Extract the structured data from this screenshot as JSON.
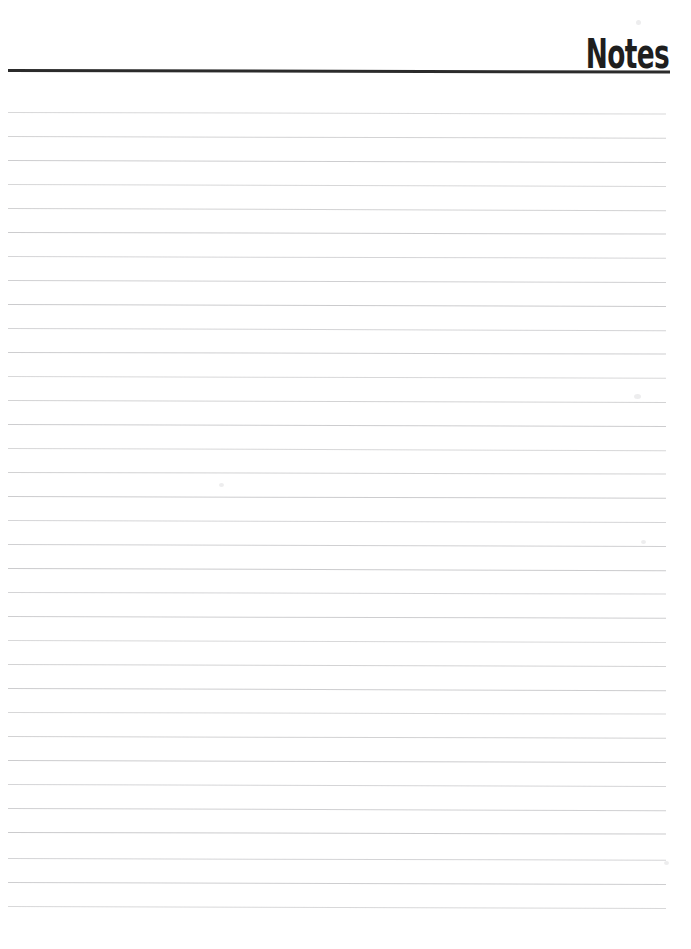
{
  "document": {
    "type": "lined-notes-page",
    "background_color": "#ffffff",
    "width": 691,
    "height": 949
  },
  "header": {
    "title": "Notes",
    "title_color": "#1e1e1e",
    "rule_color": "#2b2b2b",
    "rule_thickness_px": 3,
    "rule_left_px": 8,
    "rule_right_px": 670,
    "rule_y_px": 69,
    "title_align": "right"
  },
  "body": {
    "line_color": "#c9c9cb",
    "line_thickness_px": 1,
    "line_left_px": 8,
    "line_right_px": 666,
    "first_line_y_px": 112,
    "line_spacing_px": 24,
    "line_count": 34,
    "content_text": "",
    "lines": [
      {
        "index": 1,
        "y": 112,
        "text": ""
      },
      {
        "index": 2,
        "y": 136,
        "text": ""
      },
      {
        "index": 3,
        "y": 160,
        "text": ""
      },
      {
        "index": 4,
        "y": 184,
        "text": ""
      },
      {
        "index": 5,
        "y": 208,
        "text": ""
      },
      {
        "index": 6,
        "y": 232,
        "text": ""
      },
      {
        "index": 7,
        "y": 256,
        "text": ""
      },
      {
        "index": 8,
        "y": 280,
        "text": ""
      },
      {
        "index": 9,
        "y": 304,
        "text": ""
      },
      {
        "index": 10,
        "y": 328,
        "text": ""
      },
      {
        "index": 11,
        "y": 352,
        "text": ""
      },
      {
        "index": 12,
        "y": 376,
        "text": ""
      },
      {
        "index": 13,
        "y": 400,
        "text": ""
      },
      {
        "index": 14,
        "y": 424,
        "text": ""
      },
      {
        "index": 15,
        "y": 448,
        "text": ""
      },
      {
        "index": 16,
        "y": 472,
        "text": ""
      },
      {
        "index": 17,
        "y": 496,
        "text": ""
      },
      {
        "index": 18,
        "y": 520,
        "text": ""
      },
      {
        "index": 19,
        "y": 544,
        "text": ""
      },
      {
        "index": 20,
        "y": 568,
        "text": ""
      },
      {
        "index": 21,
        "y": 592,
        "text": ""
      },
      {
        "index": 22,
        "y": 616,
        "text": ""
      },
      {
        "index": 23,
        "y": 640,
        "text": ""
      },
      {
        "index": 24,
        "y": 664,
        "text": ""
      },
      {
        "index": 25,
        "y": 688,
        "text": ""
      },
      {
        "index": 26,
        "y": 712,
        "text": ""
      },
      {
        "index": 27,
        "y": 736,
        "text": ""
      },
      {
        "index": 28,
        "y": 760,
        "text": ""
      },
      {
        "index": 29,
        "y": 784,
        "text": ""
      },
      {
        "index": 30,
        "y": 808,
        "text": ""
      },
      {
        "index": 31,
        "y": 832,
        "text": ""
      },
      {
        "index": 32,
        "y": 858,
        "text": ""
      },
      {
        "index": 33,
        "y": 882,
        "text": ""
      },
      {
        "index": 34,
        "y": 906,
        "text": ""
      }
    ]
  },
  "artifacts": {
    "description": "faint scan speckles",
    "speckles": [
      {
        "x": 634,
        "y": 394,
        "w": 7,
        "h": 5
      },
      {
        "x": 636,
        "y": 20,
        "w": 5,
        "h": 5
      },
      {
        "x": 219,
        "y": 483,
        "w": 5,
        "h": 4
      },
      {
        "x": 641,
        "y": 540,
        "w": 5,
        "h": 4
      },
      {
        "x": 664,
        "y": 861,
        "w": 5,
        "h": 4
      }
    ]
  }
}
